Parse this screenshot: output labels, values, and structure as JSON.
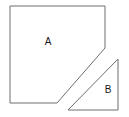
{
  "figure": {
    "background_color": "#ffffff",
    "stroke_color": "#6e6e6e",
    "label_color": "#1a1a1a",
    "width": 129,
    "height": 117,
    "shapes": [
      {
        "id": "shape-a",
        "label": "A",
        "type": "pentagon",
        "description": "Square with the lower-right corner cut off by a diagonal",
        "points": "10,6 105,6 105,48 57,103 10,103",
        "label_x": 48,
        "label_y": 42
      },
      {
        "id": "shape-b",
        "label": "B",
        "type": "right-triangle",
        "description": "Right triangle with the right angle at the bottom right",
        "points": "118,59 118,110 68,110",
        "label_x": 108,
        "label_y": 90
      }
    ]
  }
}
